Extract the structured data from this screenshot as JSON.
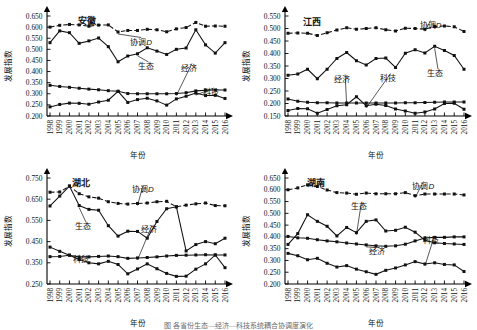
{
  "figure": {
    "caption": "图    各省份生态—经济—科技系统耦合协调度演化",
    "axis": {
      "ylabel": "发展指数",
      "xlabel": "年份"
    },
    "series_names": {
      "coordination": "协调D",
      "ecology": "生态",
      "economy": "经济",
      "technology": "科技"
    }
  },
  "chart_data": [
    {
      "type": "line",
      "title": "安徽",
      "xlabel": "年份",
      "ylabel": "发展指数",
      "ylim": [
        0.2,
        0.65
      ],
      "yticks": [
        "0.200",
        "0.250",
        "0.300",
        "0.350",
        "0.400",
        "0.450",
        "0.500",
        "0.550",
        "0.600",
        "0.650"
      ],
      "grid": false,
      "legend": "inline-annotations",
      "x": [
        1998,
        1999,
        2000,
        2001,
        2002,
        2003,
        2004,
        2005,
        2006,
        2007,
        2008,
        2009,
        2010,
        2011,
        2012,
        2013,
        2014,
        2015,
        2016
      ],
      "series": [
        {
          "name": "协调D",
          "style": "dashed",
          "values": [
            0.6,
            0.608,
            0.612,
            0.61,
            0.604,
            0.609,
            0.61,
            0.578,
            0.585,
            0.585,
            0.59,
            0.588,
            0.579,
            0.592,
            0.598,
            0.621,
            0.604,
            0.605,
            0.604
          ]
        },
        {
          "name": "生态",
          "style": "solid",
          "values": [
            0.53,
            0.583,
            0.575,
            0.527,
            0.538,
            0.551,
            0.512,
            0.444,
            0.47,
            0.48,
            0.507,
            0.492,
            0.477,
            0.5,
            0.506,
            0.588,
            0.52,
            0.483,
            0.53
          ]
        },
        {
          "name": "经济",
          "style": "solid",
          "values": [
            0.338,
            0.333,
            0.329,
            0.325,
            0.321,
            0.318,
            0.314,
            0.311,
            0.301,
            0.3,
            0.3,
            0.3,
            0.3,
            0.301,
            0.305,
            0.313,
            0.316,
            0.317,
            0.317
          ]
        },
        {
          "name": "科技",
          "style": "solid",
          "values": [
            0.241,
            0.252,
            0.258,
            0.257,
            0.253,
            0.263,
            0.271,
            0.311,
            0.261,
            0.274,
            0.28,
            0.268,
            0.249,
            0.277,
            0.289,
            0.303,
            0.292,
            0.293,
            0.279
          ]
        }
      ]
    },
    {
      "type": "line",
      "title": "江西",
      "xlabel": "年份",
      "ylabel": "发展指数",
      "ylim": [
        0.15,
        0.55
      ],
      "yticks": [
        "0.150",
        "0.200",
        "0.250",
        "0.300",
        "0.350",
        "0.400",
        "0.450",
        "0.500",
        "0.550"
      ],
      "grid": false,
      "legend": "inline-annotations",
      "x": [
        1998,
        1999,
        2000,
        2001,
        2002,
        2003,
        2004,
        2005,
        2006,
        2007,
        2008,
        2009,
        2010,
        2011,
        2012,
        2013,
        2014,
        2015,
        2016
      ],
      "series": [
        {
          "name": "协调D",
          "style": "dashed",
          "values": [
            0.481,
            0.482,
            0.481,
            0.472,
            0.483,
            0.494,
            0.503,
            0.497,
            0.5,
            0.503,
            0.495,
            0.49,
            0.501,
            0.5,
            0.497,
            0.508,
            0.51,
            0.507,
            0.488
          ]
        },
        {
          "name": "生态",
          "style": "solid",
          "values": [
            0.313,
            0.318,
            0.337,
            0.299,
            0.337,
            0.38,
            0.404,
            0.371,
            0.354,
            0.38,
            0.382,
            0.344,
            0.401,
            0.415,
            0.402,
            0.429,
            0.412,
            0.392,
            0.337
          ]
        },
        {
          "name": "经济",
          "style": "solid",
          "values": [
            0.218,
            0.209,
            0.205,
            0.203,
            0.203,
            0.202,
            0.202,
            0.202,
            0.202,
            0.202,
            0.202,
            0.202,
            0.203,
            0.203,
            0.204,
            0.205,
            0.206,
            0.206,
            0.206
          ]
        },
        {
          "name": "科技",
          "style": "solid",
          "values": [
            0.172,
            0.18,
            0.179,
            0.161,
            0.176,
            0.191,
            0.195,
            0.227,
            0.191,
            0.197,
            0.192,
            0.178,
            0.17,
            0.161,
            0.166,
            0.178,
            0.2,
            0.201,
            0.177
          ]
        }
      ]
    },
    {
      "type": "line",
      "title": "湖北",
      "xlabel": "年份",
      "ylabel": "发展指数",
      "ylim": [
        0.25,
        0.75
      ],
      "yticks": [
        "0.250",
        "0.350",
        "0.450",
        "0.550",
        "0.650",
        "0.750"
      ],
      "grid": false,
      "legend": "inline-annotations",
      "x": [
        1998,
        1999,
        2000,
        2001,
        2002,
        2003,
        2004,
        2005,
        2006,
        2007,
        2008,
        2009,
        2010,
        2011,
        2012,
        2013,
        2014,
        2015,
        2016
      ],
      "series": [
        {
          "name": "协调D",
          "style": "dashed",
          "values": [
            0.683,
            0.684,
            0.712,
            0.676,
            0.661,
            0.655,
            0.638,
            0.63,
            0.627,
            0.63,
            0.632,
            0.638,
            0.64,
            0.614,
            0.622,
            0.628,
            0.632,
            0.62,
            0.619
          ]
        },
        {
          "name": "生态",
          "style": "solid",
          "values": [
            0.618,
            0.665,
            0.712,
            0.62,
            0.602,
            0.598,
            0.525,
            0.476,
            0.499,
            0.498,
            0.466,
            0.545,
            0.605,
            0.614,
            0.406,
            0.436,
            0.45,
            0.44,
            0.466
          ]
        },
        {
          "name": "经济",
          "style": "solid",
          "values": [
            0.379,
            0.38,
            0.386,
            0.377,
            0.378,
            0.38,
            0.382,
            0.379,
            0.371,
            0.373,
            0.375,
            0.378,
            0.382,
            0.385,
            0.386,
            0.387,
            0.388,
            0.387,
            0.387
          ]
        },
        {
          "name": "科技",
          "style": "solid",
          "values": [
            0.424,
            0.404,
            0.386,
            0.366,
            0.35,
            0.345,
            0.357,
            0.342,
            0.298,
            0.321,
            0.345,
            0.322,
            0.3,
            0.286,
            0.287,
            0.32,
            0.345,
            0.387,
            0.327
          ]
        }
      ]
    },
    {
      "type": "line",
      "title": "湖南",
      "xlabel": "年份",
      "ylabel": "发展指数",
      "ylim": [
        0.2,
        0.65
      ],
      "yticks": [
        "0.200",
        "0.250",
        "0.300",
        "0.350",
        "0.400",
        "0.450",
        "0.500",
        "0.550",
        "0.600",
        "0.650"
      ],
      "grid": false,
      "legend": "inline-annotations",
      "x": [
        1998,
        1999,
        2000,
        2001,
        2002,
        2003,
        2004,
        2005,
        2006,
        2007,
        2008,
        2009,
        2010,
        2011,
        2012,
        2013,
        2014,
        2015,
        2016
      ],
      "series": [
        {
          "name": "协调D",
          "style": "dashed",
          "values": [
            0.6,
            0.608,
            0.621,
            0.614,
            0.599,
            0.588,
            0.586,
            0.581,
            0.586,
            0.583,
            0.583,
            0.583,
            0.588,
            0.575,
            0.582,
            0.582,
            0.582,
            0.582,
            0.578
          ]
        },
        {
          "name": "生态",
          "style": "solid",
          "values": [
            0.368,
            0.414,
            0.494,
            0.466,
            0.445,
            0.404,
            0.44,
            0.418,
            0.466,
            0.472,
            0.425,
            0.428,
            0.441,
            0.42,
            0.386,
            0.375,
            0.372,
            0.37,
            0.368
          ]
        },
        {
          "name": "经济",
          "style": "solid",
          "values": [
            0.402,
            0.396,
            0.394,
            0.388,
            0.383,
            0.379,
            0.374,
            0.37,
            0.366,
            0.362,
            0.36,
            0.362,
            0.369,
            0.383,
            0.395,
            0.398,
            0.398,
            0.4,
            0.4
          ]
        },
        {
          "name": "科技",
          "style": "solid",
          "values": [
            0.33,
            0.32,
            0.303,
            0.309,
            0.288,
            0.272,
            0.278,
            0.263,
            0.252,
            0.241,
            0.258,
            0.268,
            0.281,
            0.295,
            0.285,
            0.29,
            0.283,
            0.281,
            0.253
          ]
        }
      ]
    }
  ]
}
